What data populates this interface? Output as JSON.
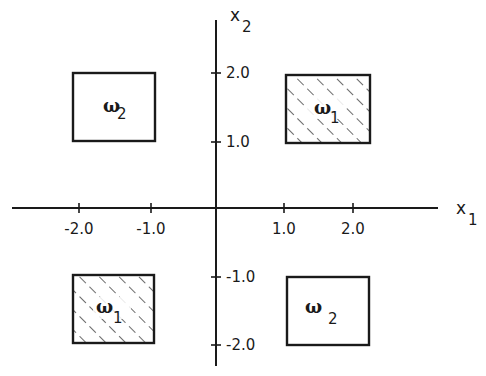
{
  "diagram": {
    "type": "decision-regions",
    "axes": {
      "x_label": "x",
      "x_label_sub": "1",
      "y_label": "x",
      "y_label_sub": "2",
      "x_ticks": [
        "-2.0",
        "-1.0",
        "1.0",
        "2.0"
      ],
      "y_ticks": [
        "2.0",
        "1.0",
        "-1.0",
        "-2.0"
      ]
    },
    "regions": [
      {
        "class": "ω",
        "sub": "2",
        "quadrant": "top-left",
        "x_range": [
          -2.0,
          -1.0
        ],
        "y_range": [
          1.0,
          2.0
        ],
        "hatched": false
      },
      {
        "class": "ω",
        "sub": "1",
        "quadrant": "top-right",
        "x_range": [
          1.0,
          2.0
        ],
        "y_range": [
          1.0,
          2.0
        ],
        "hatched": true
      },
      {
        "class": "ω",
        "sub": "1",
        "quadrant": "bottom-left",
        "x_range": [
          -2.0,
          -1.0
        ],
        "y_range": [
          -2.0,
          -1.0
        ],
        "hatched": true
      },
      {
        "class": "ω",
        "sub": "2",
        "quadrant": "bottom-right",
        "x_range": [
          1.0,
          2.0
        ],
        "y_range": [
          -2.0,
          -1.0
        ],
        "hatched": false
      }
    ],
    "colors": {
      "ink": "#1a1a1a",
      "background": "#ffffff"
    }
  }
}
